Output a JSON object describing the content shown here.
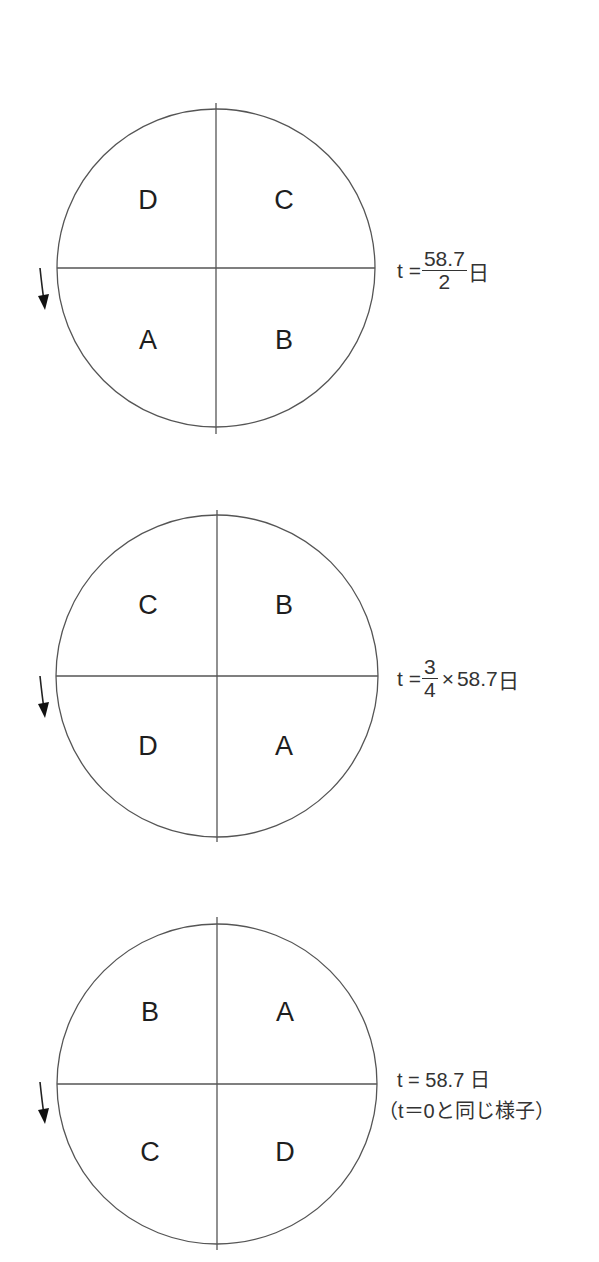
{
  "figure": {
    "panels": [
      {
        "quadrants": {
          "top_left": "D",
          "top_right": "C",
          "bottom_left": "A",
          "bottom_right": "B"
        },
        "time_label": {
          "prefix": "t =",
          "numerator": "58.7",
          "denominator": "2",
          "unit": "日"
        },
        "rotation_arrow": "down-arrow"
      },
      {
        "quadrants": {
          "top_left": "C",
          "top_right": "B",
          "bottom_left": "D",
          "bottom_right": "A"
        },
        "time_label": {
          "prefix": "t =",
          "numerator": "3",
          "denominator": "4",
          "times": "×",
          "value": "58.7",
          "unit": "日"
        },
        "rotation_arrow": "down-arrow"
      },
      {
        "quadrants": {
          "top_left": "B",
          "top_right": "A",
          "bottom_left": "C",
          "bottom_right": "D"
        },
        "time_label": {
          "text": "t = 58.7 日",
          "note": "（t＝0と同じ様子）"
        },
        "rotation_arrow": "down-arrow"
      }
    ]
  }
}
